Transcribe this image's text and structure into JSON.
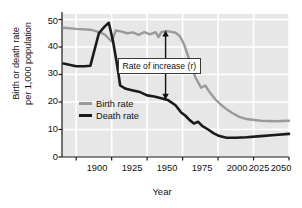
{
  "chart_data": {
    "type": "line",
    "title": "",
    "xlabel": "Year",
    "ylabel": "Birth or death rate\nper 1,000 population",
    "ylabel_line1": "Birth or death rate",
    "ylabel_line2": "per 1,000 population",
    "xlim": [
      1890,
      2050
    ],
    "ylim": [
      0,
      52
    ],
    "xticks": [
      1900,
      1925,
      1950,
      1975,
      2000,
      2025,
      2050
    ],
    "yticks": [
      0,
      10,
      20,
      30,
      40,
      50
    ],
    "grid": true,
    "legend_position": "inside-left",
    "colors": {
      "birth": "#9a9a9a",
      "death": "#1a1a1a",
      "plot_background": "#e7e7e7",
      "gridline": "#ffffff",
      "axis": "#1a1a1a"
    },
    "series": [
      {
        "name": "Birth rate",
        "color": "#9a9a9a",
        "points": [
          [
            1891,
            47.0
          ],
          [
            1900,
            46.6
          ],
          [
            1910,
            46.3
          ],
          [
            1915,
            45.6
          ],
          [
            1920,
            44.6
          ],
          [
            1925,
            42.0
          ],
          [
            1928,
            46.0
          ],
          [
            1932,
            45.6
          ],
          [
            1936,
            45.0
          ],
          [
            1940,
            45.3
          ],
          [
            1944,
            44.4
          ],
          [
            1948,
            45.4
          ],
          [
            1952,
            44.6
          ],
          [
            1956,
            45.4
          ],
          [
            1958,
            43.6
          ],
          [
            1960,
            45.4
          ],
          [
            1963,
            45.8
          ],
          [
            1966,
            45.6
          ],
          [
            1970,
            45.2
          ],
          [
            1973,
            44.0
          ],
          [
            1976,
            41.0
          ],
          [
            1980,
            35.0
          ],
          [
            1984,
            29.0
          ],
          [
            1988,
            25.2
          ],
          [
            1991,
            26.0
          ],
          [
            1994,
            23.6
          ],
          [
            1998,
            21.0
          ],
          [
            2002,
            19.0
          ],
          [
            2006,
            17.4
          ],
          [
            2010,
            16.0
          ],
          [
            2015,
            14.6
          ],
          [
            2020,
            13.8
          ],
          [
            2030,
            13.2
          ],
          [
            2040,
            13.0
          ],
          [
            2050,
            13.2
          ]
        ]
      },
      {
        "name": "Death rate",
        "color": "#1a1a1a",
        "points": [
          [
            1891,
            34.0
          ],
          [
            1900,
            33.0
          ],
          [
            1906,
            33.0
          ],
          [
            1910,
            33.2
          ],
          [
            1916,
            45.0
          ],
          [
            1920,
            47.4
          ],
          [
            1923,
            48.8
          ],
          [
            1926,
            42.0
          ],
          [
            1929,
            33.0
          ],
          [
            1931,
            26.0
          ],
          [
            1935,
            24.8
          ],
          [
            1940,
            24.2
          ],
          [
            1945,
            23.6
          ],
          [
            1950,
            22.4
          ],
          [
            1955,
            22.0
          ],
          [
            1960,
            21.4
          ],
          [
            1965,
            20.6
          ],
          [
            1970,
            18.8
          ],
          [
            1974,
            16.2
          ],
          [
            1977,
            15.0
          ],
          [
            1980,
            13.4
          ],
          [
            1983,
            12.2
          ],
          [
            1986,
            12.8
          ],
          [
            1989,
            11.2
          ],
          [
            1993,
            10.0
          ],
          [
            1997,
            8.6
          ],
          [
            2001,
            7.6
          ],
          [
            2006,
            7.0
          ],
          [
            2012,
            7.0
          ],
          [
            2020,
            7.2
          ],
          [
            2030,
            7.6
          ],
          [
            2040,
            8.0
          ],
          [
            2050,
            8.4
          ]
        ]
      }
    ],
    "annotations": [
      {
        "type": "double-arrow",
        "label": "Rate  of increase (r)",
        "x": 1963,
        "y_top": 46.0,
        "y_bottom": 20.8
      }
    ]
  },
  "legend": {
    "items": [
      {
        "label": "Birth rate",
        "color": "#9a9a9a"
      },
      {
        "label": "Death rate",
        "color": "#1a1a1a"
      }
    ]
  },
  "axes": {
    "x_title": "Year",
    "y_title_line1": "Birth or death rate",
    "y_title_line2": "per 1,000 population",
    "x_tick_labels": [
      "1900",
      "1925",
      "1950",
      "1975",
      "2000",
      "2025",
      "2050"
    ],
    "y_tick_labels": [
      "50",
      "40",
      "30",
      "20",
      "10",
      "0"
    ]
  },
  "callout": {
    "text": "Rate  of increase (r)"
  }
}
